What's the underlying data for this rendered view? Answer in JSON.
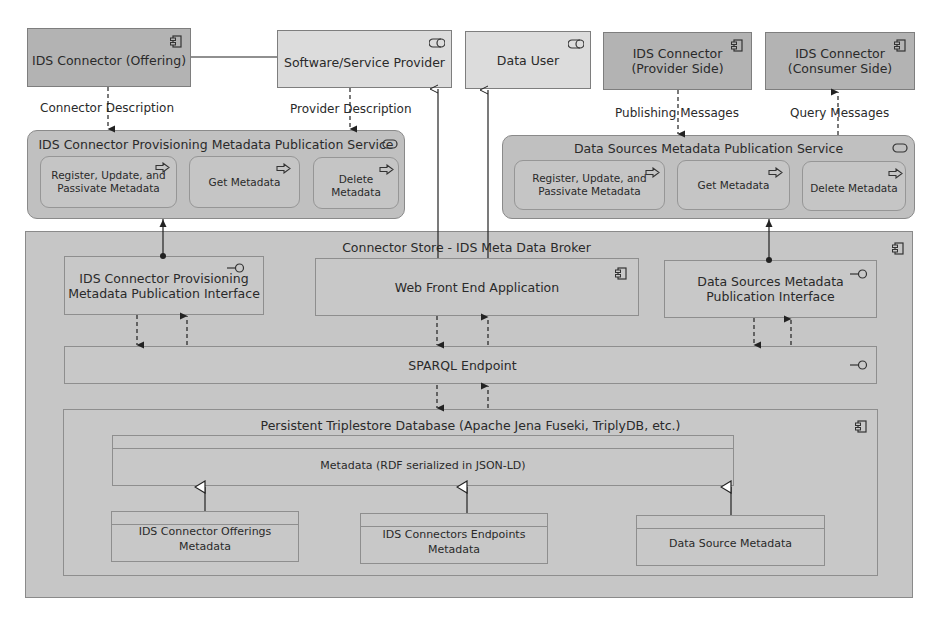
{
  "top_row": {
    "ids_offering": {
      "label": "IDS Connector (Offering)",
      "icon": "component-icon"
    },
    "software_provider": {
      "label": "Software/Service Provider",
      "icon": "role-icon"
    },
    "data_user": {
      "label": "Data User",
      "icon": "role-icon"
    },
    "provider_side": {
      "line1": "IDS Connector",
      "line2": "(Provider Side)",
      "icon": "component-icon"
    },
    "consumer_side": {
      "line1": "IDS Connector",
      "line2": "(Consumer Side)",
      "icon": "component-icon"
    }
  },
  "flow_labels": {
    "connector_description": "Connector Description",
    "provider_description": "Provider Description",
    "publishing_messages": "Publishing Messages",
    "query_messages": "Query Messages"
  },
  "provisioning_service": {
    "title": "IDS Connector Provisioning Metadata Publication Service",
    "icon": "service-icon",
    "functions": [
      {
        "line1": "Register, Update, and",
        "line2": "Passivate Metadata",
        "icon": "function-arrow-icon"
      },
      {
        "line1": "Get Metadata",
        "line2": "",
        "icon": "function-arrow-icon"
      },
      {
        "line1": "Delete Metadata",
        "line2": "",
        "icon": "function-arrow-icon"
      }
    ]
  },
  "datasources_service": {
    "title": "Data Sources Metadata Publication Service",
    "icon": "service-icon",
    "functions": [
      {
        "line1": "Register, Update, and",
        "line2": "Passivate Metadata",
        "icon": "function-arrow-icon"
      },
      {
        "line1": "Get Metadata",
        "line2": "",
        "icon": "function-arrow-icon"
      },
      {
        "line1": "Delete Metadata",
        "line2": "",
        "icon": "function-arrow-icon"
      }
    ]
  },
  "broker": {
    "title": "Connector Store - IDS Meta Data Broker",
    "icon": "component-icon",
    "provisioning_interface": {
      "line1": "IDS Connector Provisioning",
      "line2": "Metadata Publication Interface",
      "icon": "interface-icon"
    },
    "web_front_end": {
      "label": "Web Front End Application",
      "icon": "component-icon"
    },
    "datasources_interface": {
      "line1": "Data Sources Metadata",
      "line2": "Publication Interface",
      "icon": "interface-icon"
    },
    "sparql": {
      "label": "SPARQL Endpoint",
      "icon": "interface-icon"
    },
    "triplestore": {
      "title": "Persistent Triplestore Database (Apache Jena Fuseki, TriplyDB, etc.)",
      "icon": "component-icon",
      "metadata": {
        "label": "Metadata (RDF serialized in JSON-LD)"
      },
      "subclasses": [
        {
          "line1": "IDS Connector Offerings",
          "line2": "Metadata"
        },
        {
          "line1": "IDS Connectors Endpoints Metadata",
          "line2": ""
        },
        {
          "line1": "Data Source Metadata",
          "line2": ""
        }
      ]
    }
  }
}
